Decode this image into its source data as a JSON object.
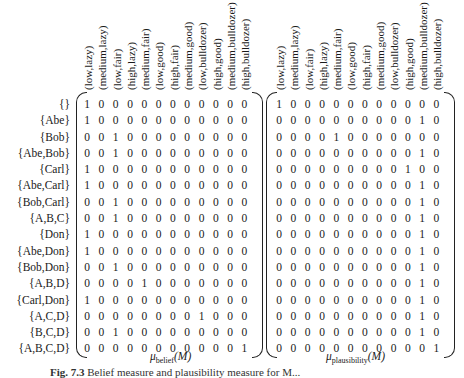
{
  "columns": [
    "(low,lazy)",
    "(medium,lazy)",
    "(low,fair)",
    "(high,lazy)",
    "(medium,fair)",
    "(low,good)",
    "(high,fair)",
    "(medium,good)",
    "(low,bulldozer)",
    "(high,good)",
    "(medium,bulldozer)",
    "(high,bulldozer)"
  ],
  "rows": [
    "{}",
    "{Abe}",
    "{Bob}",
    "{Abe,Bob}",
    "{Carl}",
    "{Abe,Carl}",
    "{Bob,Carl}",
    "{A,B,C}",
    "{Don}",
    "{Abe,Don}",
    "{Bob,Don}",
    "{A,B,D}",
    "{Carl,Don}",
    "{A,C,D}",
    "{B,C,D}",
    "{A,B,C,D}"
  ],
  "belief": {
    "label_main": "μ",
    "label_sub": "belief",
    "label_arg": "(M)",
    "ones_col": [
      0,
      0,
      2,
      2,
      0,
      0,
      2,
      2,
      0,
      0,
      2,
      4,
      0,
      8,
      2,
      11
    ]
  },
  "plausibility": {
    "label_main": "μ",
    "label_sub": "plausibility",
    "label_arg": "(M)",
    "ones_col": [
      0,
      10,
      4,
      10,
      9,
      10,
      10,
      10,
      10,
      10,
      10,
      10,
      10,
      10,
      10,
      11
    ]
  },
  "caption": {
    "fig": "Fig. 7.3",
    "text": "Belief measure and plausibility measure for M..."
  }
}
